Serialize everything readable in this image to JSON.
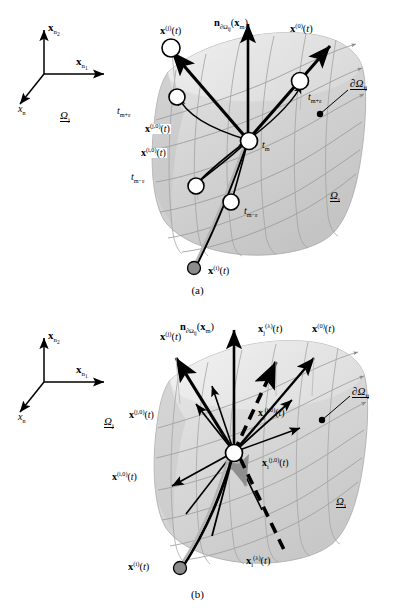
{
  "figure": {
    "type": "vector-field-discontinuity-diagram",
    "panels": [
      {
        "id": "a",
        "caption": "(b)",
        "axes": {
          "origin_label": "",
          "items": [
            {
              "name": "axis-x-n2",
              "tex": "x_{n_2}",
              "base": "x",
              "sub": "n₂"
            },
            {
              "name": "axis-x-n1",
              "tex": "x_{n_1}",
              "base": "x",
              "sub": "n₁"
            },
            {
              "name": "axis-x-n",
              "tex": "x_n",
              "base": "x",
              "sub": "n"
            }
          ]
        },
        "domains": [
          {
            "name": "domain-omega-j",
            "base": "Ω",
            "sub": "j"
          },
          {
            "name": "domain-omega-i",
            "base": "Ω",
            "sub": "i"
          },
          {
            "name": "boundary-d-omega-ij",
            "base": "∂Ω",
            "sub": "ij"
          }
        ],
        "vectors": [
          {
            "name": "vector-x-j",
            "base": "x",
            "sup": "(j)",
            "arg": "(t)"
          },
          {
            "name": "vector-normal",
            "base": "n",
            "sub": "∂Ω",
            "sub2": "ij",
            "arg": "(x",
            "argsub": "m",
            "argend": ")"
          },
          {
            "name": "vector-x-0",
            "base": "x",
            "sup": "(0)",
            "arg": "(t)"
          },
          {
            "name": "vector-x-j0",
            "base": "x",
            "sup": "(j,0)",
            "arg": "(t)"
          },
          {
            "name": "vector-x-i0",
            "base": "x",
            "sup": "(i,0)",
            "arg": "(t)"
          },
          {
            "name": "vector-x-i",
            "base": "x",
            "sup": "(i)",
            "arg": "(t)"
          }
        ],
        "time_labels": [
          {
            "name": "time-m-plus-eps",
            "base": "t",
            "sub": "m+ε"
          },
          {
            "name": "time-m",
            "base": "t",
            "sub": "m"
          },
          {
            "name": "time-m-minus-eps-left",
            "base": "t",
            "sub": "m−ε"
          },
          {
            "name": "time-m-minus-eps-right",
            "base": "t",
            "sub": "m−ε"
          },
          {
            "name": "time-m-plus-eps-right",
            "base": "t",
            "sub": "m+ε"
          }
        ]
      },
      {
        "id": "b",
        "caption": "(b)",
        "axes": {
          "items": [
            {
              "name": "axis-x-n2",
              "base": "x",
              "sub": "n₂"
            },
            {
              "name": "axis-x-n1",
              "base": "x",
              "sub": "n₁"
            },
            {
              "name": "axis-x-n",
              "base": "x",
              "sub": "n"
            }
          ]
        },
        "domains": [
          {
            "name": "domain-omega-j",
            "base": "Ω",
            "sub": "j"
          },
          {
            "name": "domain-omega-i",
            "base": "Ω",
            "sub": "i"
          },
          {
            "name": "boundary-d-omega-ij",
            "base": "∂Ω",
            "sub": "ij"
          }
        ],
        "vectors": [
          {
            "name": "vector-x-j",
            "base": "x",
            "sup": "(j)",
            "arg": "(t)"
          },
          {
            "name": "vector-normal",
            "base": "n",
            "arg": "(x",
            "argsub": "m",
            "argend": ")"
          },
          {
            "name": "vector-x-lambda-j",
            "base": "x",
            "sub": "j",
            "sup": "(λ)",
            "arg": "(t)"
          },
          {
            "name": "vector-x-0",
            "base": "x",
            "sup": "(0)",
            "arg": "(t)"
          },
          {
            "name": "vector-x-j0",
            "base": "x",
            "sup": "(j,0)",
            "arg": "(t)"
          },
          {
            "name": "vector-x-i0",
            "base": "x",
            "sup": "(i,0)",
            "arg": "(t)"
          },
          {
            "name": "vector-x-j-i0",
            "base": "x",
            "sub": "j",
            "sup": "(i,0)",
            "arg": "(t)"
          },
          {
            "name": "vector-x-i-j0",
            "base": "x",
            "sub": "i",
            "sup": "(j,0)",
            "arg": "(t)"
          },
          {
            "name": "vector-x-i",
            "base": "x",
            "sup": "(i)",
            "arg": "(t)"
          },
          {
            "name": "vector-x-lambda-i",
            "base": "x",
            "sub": "i",
            "sup": "(λ)",
            "arg": "(t)"
          }
        ]
      }
    ],
    "captions": {
      "a": "(a)",
      "b": "(b)"
    },
    "colors": {
      "ink": "#000000",
      "surface_light": "#f0f0f0",
      "surface_mid": "#d8d8d8",
      "surface_dark": "#bdbdbd",
      "grid": "#9a9a9a",
      "marker_fill": "#ffffff",
      "dot_fill": "#8c8c8c",
      "gray_arrow": "#b0b0b0"
    }
  }
}
